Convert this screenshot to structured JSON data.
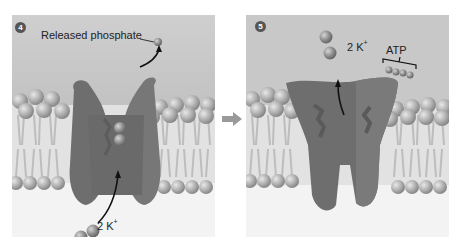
{
  "panels": [
    {
      "step": "4",
      "labels": {
        "released_phosphate": "Released phosphate",
        "ions_label_prefix": "2 K",
        "ions_label_sup": "+"
      }
    },
    {
      "step": "5",
      "labels": {
        "ions_label_prefix": "2 K",
        "ions_label_sup": "+",
        "atp": "ATP"
      }
    }
  ],
  "colors": {
    "extracellular": "#c8c8c8",
    "intracellular": "#f2f2f2",
    "membrane_core": "#dcdcdc",
    "lipid_head": "#a9a9a9",
    "protein_dark": "#6b6b6b",
    "protein_mid": "#7d7d7d",
    "ion": "#8c8c8c",
    "arrow": "#111111"
  }
}
